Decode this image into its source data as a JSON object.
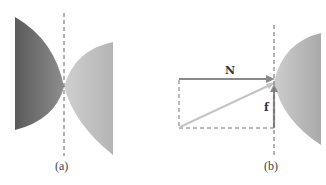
{
  "figure": {
    "panels": [
      {
        "id": "a",
        "caption": "(a)",
        "description": "Two curved bodies touching at a single point along a dashed vertical axis"
      },
      {
        "id": "b",
        "caption": "(b)",
        "description": "Force decomposition at contact point: normal force N, friction force f, and resultant diagonal",
        "vectors": [
          {
            "name": "N",
            "label": "N",
            "direction": "horizontal-right"
          },
          {
            "name": "f",
            "label": "f",
            "direction": "vertical-up"
          },
          {
            "name": "resultant",
            "label": "",
            "direction": "diagonal"
          }
        ]
      }
    ]
  },
  "colors": {
    "dark_body": "#6f6f6f",
    "light_body": "#bdbdbd",
    "vector": "#8a8a8a",
    "resultant": "#c4c4c4",
    "dashed": "#666666"
  }
}
